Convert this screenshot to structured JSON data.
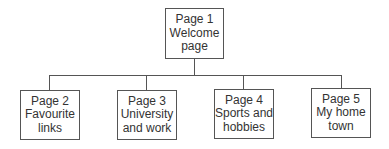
{
  "diagram": {
    "type": "site-map hierarchy",
    "root": {
      "id": "page1",
      "title": "Page 1",
      "line2": "Welcome",
      "line3": "page"
    },
    "children": [
      {
        "id": "page2",
        "title": "Page 2",
        "line2": "Favourite",
        "line3": "links"
      },
      {
        "id": "page3",
        "title": "Page 3",
        "line2": "University",
        "line3": "and work"
      },
      {
        "id": "page4",
        "title": "Page 4",
        "line2": "Sports and",
        "line3": "hobbies"
      },
      {
        "id": "page5",
        "title": "Page 5",
        "line2": "My home",
        "line3": "town"
      }
    ],
    "colors": {
      "border": "#555555",
      "text": "#333333",
      "background": "#ffffff"
    }
  }
}
